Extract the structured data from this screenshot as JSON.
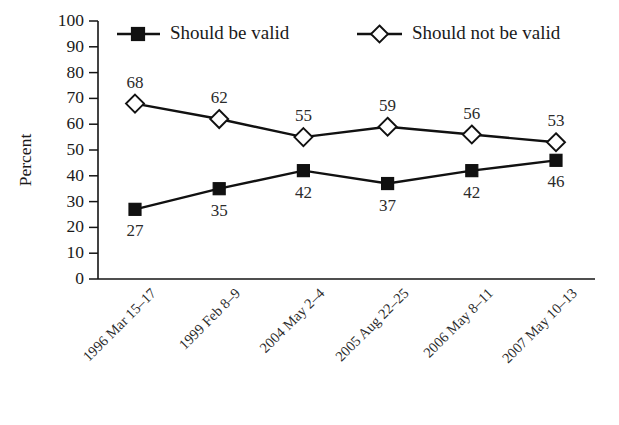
{
  "chart_data": {
    "type": "line",
    "title": "",
    "subtitle": "",
    "xlabel": "",
    "ylabel": "Percent",
    "ylim": [
      0,
      100
    ],
    "yticks": [
      0,
      10,
      20,
      30,
      40,
      50,
      60,
      70,
      80,
      90,
      100
    ],
    "grid": false,
    "legend_position": "top",
    "categories": [
      "1996 Mar 15–17",
      "1999 Feb 8–9",
      "2004 May 2–4",
      "2005 Aug 22–25",
      "2006 May 8–11",
      "2007 May 10–13"
    ],
    "series": [
      {
        "name": "Should be valid",
        "marker": "filled-square",
        "color": "#111111",
        "values": [
          27,
          35,
          42,
          37,
          42,
          46
        ],
        "label_positions": [
          "below",
          "below",
          "below",
          "below",
          "below",
          "below"
        ]
      },
      {
        "name": "Should not be valid",
        "marker": "open-diamond",
        "color": "#111111",
        "values": [
          68,
          62,
          55,
          59,
          56,
          53
        ],
        "label_positions": [
          "above",
          "above",
          "above",
          "above",
          "above",
          "above"
        ]
      }
    ]
  },
  "legend": {
    "items": [
      {
        "label": "Should be valid",
        "marker": "filled-square"
      },
      {
        "label": "Should not be valid",
        "marker": "open-diamond"
      }
    ]
  },
  "axis": {
    "y_title": "Percent",
    "y_tick_labels": [
      "100",
      "90",
      "80",
      "70",
      "60",
      "50",
      "40",
      "30",
      "20",
      "10",
      "0"
    ],
    "x_tick_labels": [
      "1996 Mar 15–17",
      "1999 Feb 8–9",
      "2004 May 2–4",
      "2005 Aug 22–25",
      "2006 May 8–11",
      "2007 May 10–13"
    ]
  },
  "data_labels": {
    "should_be_valid": [
      "27",
      "35",
      "42",
      "37",
      "42",
      "46"
    ],
    "should_not_be_valid": [
      "68",
      "62",
      "55",
      "59",
      "56",
      "53"
    ]
  },
  "colors": {
    "ink": "#111111",
    "background": "#ffffff"
  }
}
